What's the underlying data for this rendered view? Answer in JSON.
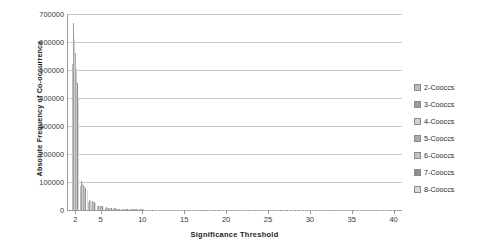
{
  "chart_data": {
    "type": "bar",
    "title": "",
    "xlabel": "Significance  Threshold",
    "ylabel": "Absolute Frequency of Co-occurrence",
    "xlim": [
      1,
      41
    ],
    "ylim": [
      0,
      700000
    ],
    "grid": true,
    "legend_position": "right",
    "y_ticks": [
      0,
      100000,
      200000,
      300000,
      400000,
      500000,
      600000,
      700000
    ],
    "y_tick_labels": [
      "0",
      "100000",
      "200000",
      "300000",
      "400000",
      "500000",
      "600000",
      "700000"
    ],
    "x_ticks": [
      2,
      5,
      10,
      15,
      20,
      25,
      30,
      35,
      40
    ],
    "x_tick_labels": [
      "2",
      "5",
      "10",
      "15",
      "20",
      "25",
      "30",
      "35",
      "40"
    ],
    "x": [
      2,
      3,
      4,
      5,
      6,
      7,
      8,
      9,
      10,
      11,
      12,
      13,
      14,
      15,
      16,
      17,
      18,
      19,
      20,
      21,
      22,
      23,
      24,
      25,
      26,
      27,
      28,
      29,
      30,
      31,
      32,
      33,
      34,
      35,
      36,
      37,
      38,
      39,
      40
    ],
    "series": [
      {
        "name": "2-Cooccs",
        "color": "#bdbdbd",
        "values": [
          521000,
          86000,
          30000,
          14000,
          8000,
          5200,
          3600,
          2600,
          2000,
          1600,
          1300,
          1100,
          950,
          830,
          740,
          660,
          600,
          550,
          500,
          460,
          430,
          400,
          375,
          350,
          330,
          310,
          295,
          280,
          266,
          254,
          243,
          232,
          223,
          214,
          206,
          198,
          191,
          185,
          179
        ]
      },
      {
        "name": "3-Cooccs",
        "color": "#9e9e9e",
        "values": [
          668000,
          104000,
          34000,
          16000,
          9000,
          5800,
          4000,
          2900,
          2200,
          1750,
          1430,
          1200,
          1030,
          900,
          800,
          715,
          645,
          590,
          540,
          500,
          465,
          432,
          404,
          378,
          356,
          336,
          318,
          302,
          287,
          274,
          261,
          250,
          240,
          230,
          221,
          213,
          205,
          198,
          192
        ]
      },
      {
        "name": "4-Cooccs",
        "color": "#d0d0d0",
        "values": [
          612000,
          95000,
          31500,
          14800,
          8400,
          5400,
          3700,
          2700,
          2060,
          1640,
          1340,
          1130,
          965,
          845,
          750,
          670,
          606,
          553,
          508,
          469,
          436,
          406,
          380,
          356,
          335,
          316,
          299,
          284,
          270,
          258,
          246,
          236,
          226,
          217,
          209,
          201,
          194,
          187,
          181
        ]
      },
      {
        "name": "5-Cooccs",
        "color": "#aaaaaa",
        "values": [
          560000,
          90000,
          30500,
          14300,
          8150,
          5250,
          3620,
          2640,
          2010,
          1600,
          1310,
          1105,
          944,
          826,
          734,
          656,
          593,
          542,
          497,
          459,
          427,
          397,
          372,
          348,
          328,
          309,
          293,
          278,
          264,
          252,
          241,
          231,
          221,
          212,
          204,
          197,
          190,
          183,
          177
        ]
      },
      {
        "name": "6-Cooccs",
        "color": "#c4c4c4",
        "values": [
          505000,
          84000,
          29000,
          13700,
          7850,
          5060,
          3490,
          2545,
          1940,
          1545,
          1262,
          1066,
          910,
          797,
          708,
          633,
          572,
          522,
          480,
          443,
          412,
          383,
          358,
          336,
          316,
          299,
          283,
          269,
          255,
          244,
          233,
          223,
          214,
          205,
          197,
          190,
          183,
          177,
          171
        ]
      },
      {
        "name": "7-Cooccs",
        "color": "#8f8f8f",
        "values": [
          452000,
          78000,
          27200,
          12900,
          7420,
          4790,
          3305,
          2410,
          1838,
          1464,
          1196,
          1010,
          863,
          755,
          671,
          600,
          542,
          495,
          454,
          420,
          390,
          363,
          340,
          318,
          300,
          283,
          268,
          255,
          242,
          231,
          221,
          212,
          203,
          195,
          187,
          180,
          174,
          168,
          162
        ]
      },
      {
        "name": "8-Cooccs",
        "color": "#dadada",
        "values": [
          398000,
          71000,
          25000,
          11900,
          6880,
          4450,
          3070,
          2240,
          1710,
          1362,
          1113,
          940,
          804,
          703,
          625,
          559,
          505,
          461,
          423,
          391,
          364,
          338,
          316,
          297,
          279,
          264,
          250,
          237,
          226,
          215,
          206,
          197,
          189,
          181,
          174,
          168,
          162,
          156,
          151
        ]
      }
    ]
  },
  "legend": {
    "items": [
      {
        "label": "2-Cooccs"
      },
      {
        "label": "3-Cooccs"
      },
      {
        "label": "4-Cooccs"
      },
      {
        "label": "5-Cooccs"
      },
      {
        "label": "6-Cooccs"
      },
      {
        "label": "7-Cooccs"
      },
      {
        "label": "8-Cooccs"
      }
    ]
  }
}
